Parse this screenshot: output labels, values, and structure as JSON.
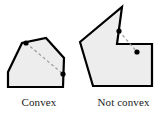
{
  "figure": {
    "canvas": {
      "width": 165,
      "height": 114,
      "background": "#ffffff"
    },
    "style": {
      "polygon_fill": "#ededed",
      "polygon_stroke": "#000000",
      "polygon_stroke_width": 2.2,
      "dashed_segment_color": "#9a9a9a",
      "dashed_segment_width": 1.2,
      "dash_pattern": "3,2.5",
      "vertex_dot_color": "#000000",
      "vertex_dot_radius": 2.6,
      "caption_color": "#1a1a1a"
    },
    "panels": [
      {
        "id": "convex",
        "caption": "Convex",
        "polygon_points": "8,72 22,43 46,38 64,58 63,87 8,87",
        "marked_points": [
          {
            "label": "point-a",
            "x": 26,
            "y": 43
          },
          {
            "label": "point-b",
            "x": 63,
            "y": 74
          }
        ],
        "segment_inside": true
      },
      {
        "id": "not-convex",
        "caption": "Not convex",
        "polygon_points": "80,42 122,7 117,44 152,44 152,86 93,86",
        "marked_points": [
          {
            "label": "point-c",
            "x": 119,
            "y": 31
          },
          {
            "label": "point-d",
            "x": 137,
            "y": 52
          }
        ],
        "segment_inside": false
      }
    ]
  }
}
